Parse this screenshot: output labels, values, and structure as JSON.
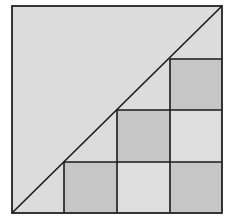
{
  "diagram": {
    "type": "grid-staircase-under-diagonal",
    "colors": {
      "background": "#ffffff",
      "light_fill": "#dcdcdc",
      "dark_fill": "#c6c6c6",
      "line": "#1a1a1a"
    },
    "outer_square": {
      "x": 12,
      "y": 6,
      "size": 210
    },
    "grid_cells": [
      {
        "col": 1,
        "row": 3,
        "shade": "dark"
      },
      {
        "col": 2,
        "row": 3,
        "shade": "light"
      },
      {
        "col": 3,
        "row": 3,
        "shade": "dark"
      },
      {
        "col": 2,
        "row": 2,
        "shade": "dark"
      },
      {
        "col": 3,
        "row": 2,
        "shade": "light"
      },
      {
        "col": 3,
        "row": 1,
        "shade": "dark"
      }
    ],
    "diagonal": {
      "from": "bottom-left",
      "to": "top-right"
    }
  }
}
